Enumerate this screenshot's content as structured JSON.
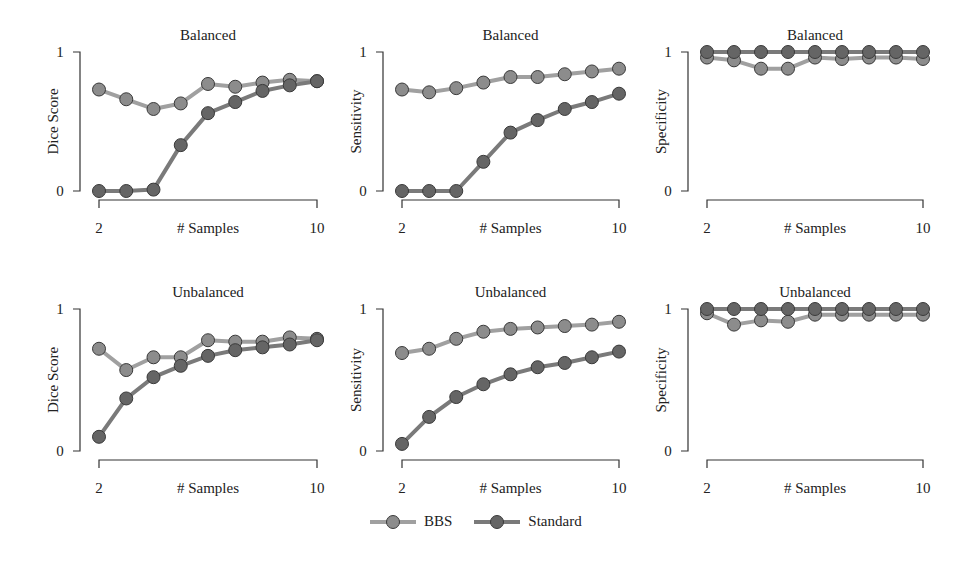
{
  "figure": {
    "x_label": "# Samples",
    "x_ticks": [
      "2",
      "10"
    ],
    "y_ticks": [
      "0",
      "1"
    ]
  },
  "legend": {
    "items": [
      {
        "label": "BBS",
        "line_color": "#a0a0a0",
        "marker_color": "#8c8c8c"
      },
      {
        "label": "Standard",
        "line_color": "#7a7a7a",
        "marker_color": "#656565"
      }
    ]
  },
  "chart_data": [
    {
      "type": "line",
      "title": "Balanced",
      "xlabel": "# Samples",
      "ylabel": "Dice Score",
      "xlim": [
        2,
        10
      ],
      "ylim": [
        0,
        1
      ],
      "x": [
        2,
        3,
        4,
        5,
        6,
        7,
        8,
        9,
        10
      ],
      "series": [
        {
          "name": "BBS",
          "values": [
            0.73,
            0.66,
            0.59,
            0.63,
            0.77,
            0.75,
            0.78,
            0.8,
            0.79
          ]
        },
        {
          "name": "Standard",
          "values": [
            0.0,
            0.0,
            0.01,
            0.33,
            0.56,
            0.64,
            0.72,
            0.76,
            0.79
          ]
        }
      ]
    },
    {
      "type": "line",
      "title": "Balanced",
      "xlabel": "# Samples",
      "ylabel": "Sensitivity",
      "xlim": [
        2,
        10
      ],
      "ylim": [
        0,
        1
      ],
      "x": [
        2,
        3,
        4,
        5,
        6,
        7,
        8,
        9,
        10
      ],
      "series": [
        {
          "name": "BBS",
          "values": [
            0.73,
            0.71,
            0.74,
            0.78,
            0.82,
            0.82,
            0.84,
            0.86,
            0.88
          ]
        },
        {
          "name": "Standard",
          "values": [
            0.0,
            0.0,
            0.0,
            0.21,
            0.42,
            0.51,
            0.59,
            0.64,
            0.7
          ]
        }
      ]
    },
    {
      "type": "line",
      "title": "Balanced",
      "xlabel": "# Samples",
      "ylabel": "Specificity",
      "xlim": [
        2,
        10
      ],
      "ylim": [
        0,
        1
      ],
      "x": [
        2,
        3,
        4,
        5,
        6,
        7,
        8,
        9,
        10
      ],
      "series": [
        {
          "name": "BBS",
          "values": [
            0.96,
            0.94,
            0.88,
            0.88,
            0.96,
            0.95,
            0.96,
            0.96,
            0.95
          ]
        },
        {
          "name": "Standard",
          "values": [
            1.0,
            1.0,
            1.0,
            1.0,
            1.0,
            1.0,
            1.0,
            1.0,
            1.0
          ]
        }
      ]
    },
    {
      "type": "line",
      "title": "Unbalanced",
      "xlabel": "# Samples",
      "ylabel": "Dice Score",
      "xlim": [
        2,
        10
      ],
      "ylim": [
        0,
        1
      ],
      "x": [
        2,
        3,
        4,
        5,
        6,
        7,
        8,
        9,
        10
      ],
      "series": [
        {
          "name": "BBS",
          "values": [
            0.72,
            0.57,
            0.66,
            0.66,
            0.78,
            0.77,
            0.77,
            0.8,
            0.79
          ]
        },
        {
          "name": "Standard",
          "values": [
            0.1,
            0.37,
            0.52,
            0.6,
            0.67,
            0.71,
            0.73,
            0.75,
            0.78
          ]
        }
      ]
    },
    {
      "type": "line",
      "title": "Unbalanced",
      "xlabel": "# Samples",
      "ylabel": "Sensitivity",
      "xlim": [
        2,
        10
      ],
      "ylim": [
        0,
        1
      ],
      "x": [
        2,
        3,
        4,
        5,
        6,
        7,
        8,
        9,
        10
      ],
      "series": [
        {
          "name": "BBS",
          "values": [
            0.69,
            0.72,
            0.79,
            0.84,
            0.86,
            0.87,
            0.88,
            0.89,
            0.91
          ]
        },
        {
          "name": "Standard",
          "values": [
            0.05,
            0.24,
            0.38,
            0.47,
            0.54,
            0.59,
            0.62,
            0.66,
            0.7
          ]
        }
      ]
    },
    {
      "type": "line",
      "title": "Unbalanced",
      "xlabel": "# Samples",
      "ylabel": "Specificity",
      "xlim": [
        2,
        10
      ],
      "ylim": [
        0,
        1
      ],
      "x": [
        2,
        3,
        4,
        5,
        6,
        7,
        8,
        9,
        10
      ],
      "series": [
        {
          "name": "BBS",
          "values": [
            0.97,
            0.89,
            0.92,
            0.91,
            0.96,
            0.96,
            0.96,
            0.96,
            0.96
          ]
        },
        {
          "name": "Standard",
          "values": [
            1.0,
            1.0,
            1.0,
            1.0,
            1.0,
            1.0,
            1.0,
            1.0,
            1.0
          ]
        }
      ]
    }
  ]
}
